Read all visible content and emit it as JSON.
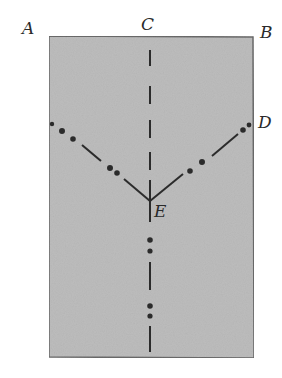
{
  "diagram": {
    "labels": {
      "a": "A",
      "b": "B",
      "c": "C",
      "d": "D",
      "e": "E"
    },
    "colors": {
      "paper": "#bdbdbd",
      "line": "#2b2b2b",
      "edge": "#6a6a6a"
    }
  }
}
